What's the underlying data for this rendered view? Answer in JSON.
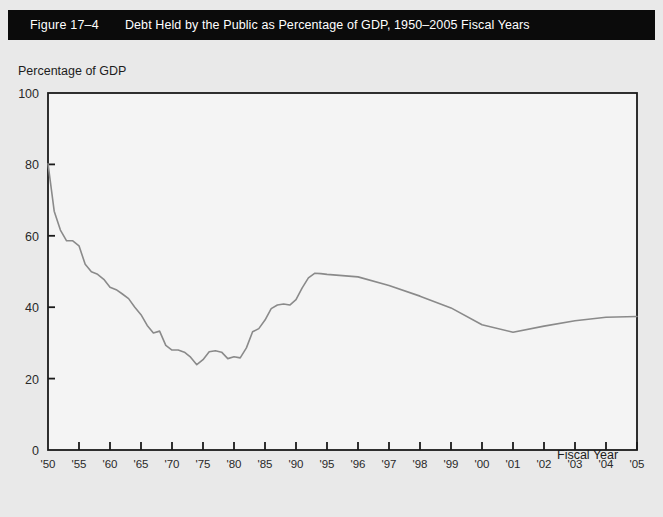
{
  "banner": {
    "figure_number": "Figure 17–4",
    "figure_title": "Debt Held by the Public as Percentage of GDP, 1950–2005 Fiscal Years",
    "background_color": "#0b0b0b",
    "text_color": "#ffffff"
  },
  "page": {
    "background_color": "#e9e9e9",
    "plot_background_color": "#f4f4f4",
    "frame_color": "#1a1a1a",
    "line_color": "#8a8a8a"
  },
  "chart_data": {
    "type": "line",
    "title": "Debt Held by the Public as Percentage of GDP, 1950–2005 Fiscal Years",
    "xlabel": "Fiscal Year",
    "ylabel": "Percentage of GDP",
    "ylim": [
      0,
      100
    ],
    "yticks": [
      0,
      20,
      40,
      60,
      80,
      100
    ],
    "ytick_labels": [
      "0",
      "20",
      "40",
      "60",
      "80",
      "100"
    ],
    "xtick_labels": [
      "'50",
      "'55",
      "'60",
      "'65",
      "'70",
      "'75",
      "'80",
      "'85",
      "'90",
      "'95",
      "'96",
      "'97",
      "'98",
      "'99",
      "'00",
      "'01",
      "'02",
      "'03",
      "'04",
      "'05"
    ],
    "xtick_years": [
      1950,
      1955,
      1960,
      1965,
      1970,
      1975,
      1980,
      1985,
      1990,
      1995,
      1996,
      1997,
      1998,
      1999,
      2000,
      2001,
      2002,
      2003,
      2004,
      2005
    ],
    "x_axis_note": "Axis is piecewise: five-year spacing from 1950 to 1995, then one-year spacing from 1995 to 2005; each labeled tick is evenly spaced.",
    "grid": false,
    "legend": null,
    "series": [
      {
        "name": "Debt Held by the Public as Percentage of GDP",
        "x": [
          1950,
          1951,
          1952,
          1953,
          1954,
          1955,
          1956,
          1957,
          1958,
          1959,
          1960,
          1961,
          1962,
          1963,
          1964,
          1965,
          1966,
          1967,
          1968,
          1969,
          1970,
          1971,
          1972,
          1973,
          1974,
          1975,
          1976,
          1977,
          1978,
          1979,
          1980,
          1981,
          1982,
          1983,
          1984,
          1985,
          1986,
          1987,
          1988,
          1989,
          1990,
          1991,
          1992,
          1993,
          1994,
          1995,
          1996,
          1997,
          1998,
          1999,
          2000,
          2001,
          2002,
          2003,
          2004,
          2005
        ],
        "values": [
          80.2,
          66.9,
          61.6,
          58.6,
          58.6,
          57.2,
          52.0,
          49.9,
          49.2,
          47.8,
          45.6,
          44.9,
          43.7,
          42.4,
          40.0,
          37.9,
          34.9,
          32.8,
          33.3,
          29.3,
          28.0,
          28.0,
          27.4,
          26.0,
          23.9,
          25.3,
          27.5,
          27.8,
          27.4,
          25.6,
          26.1,
          25.8,
          28.6,
          33.1,
          34.0,
          36.4,
          39.6,
          40.6,
          40.9,
          40.6,
          42.1,
          45.4,
          48.2,
          49.5,
          49.4,
          49.2,
          48.5,
          46.1,
          43.1,
          39.8,
          35.1,
          33.0,
          34.7,
          36.2,
          37.2,
          37.4
        ]
      }
    ],
    "annotations": {
      "start_1950": 80.2,
      "trough_1974": 23.9,
      "peak_1993": 49.5,
      "local_min_2001": 33.0,
      "end_2005": 37.4
    }
  }
}
